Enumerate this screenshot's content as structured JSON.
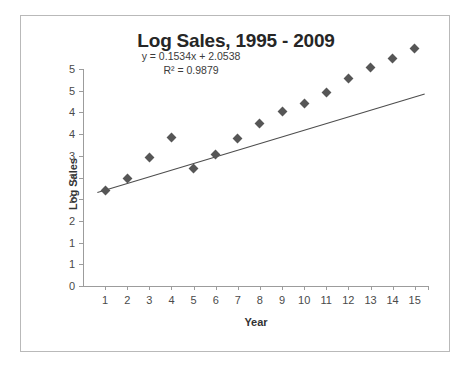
{
  "chart_data": {
    "type": "scatter",
    "title": "Log Sales, 1995 - 2009",
    "xlabel": "Year",
    "ylabel": "Log Sales",
    "x": [
      1,
      2,
      3,
      4,
      5,
      6,
      7,
      8,
      9,
      10,
      11,
      12,
      13,
      14,
      15
    ],
    "values": [
      2.21,
      2.48,
      2.97,
      3.42,
      2.7,
      3.03,
      3.39,
      3.74,
      4.02,
      4.21,
      4.46,
      4.79,
      5.04,
      5.24,
      5.47
    ],
    "series": [
      {
        "name": "Log Sales",
        "values": [
          2.21,
          2.48,
          2.97,
          3.42,
          2.7,
          3.03,
          3.39,
          3.74,
          4.02,
          4.21,
          4.46,
          4.79,
          5.04,
          5.24,
          5.47
        ]
      }
    ],
    "xlim": [
      0,
      15.6
    ],
    "ylim": [
      0,
      5
    ],
    "x_tick_labels": [
      "1",
      "2",
      "3",
      "4",
      "5",
      "6",
      "7",
      "8",
      "9",
      "10",
      "11",
      "12",
      "13",
      "14",
      "15"
    ],
    "y_ticks": [
      0,
      0.5,
      1,
      1.5,
      2,
      2.5,
      3,
      3.5,
      4,
      4.5,
      5
    ],
    "y_tick_labels": [
      "0",
      "1",
      "1",
      "2",
      "2",
      "3",
      "3",
      "4",
      "4",
      "5",
      "5"
    ],
    "grid": false,
    "legend": false,
    "trendline": {
      "equation": "y = 0.1534x + 2.0538",
      "r_squared_label": "R² = 0.9879",
      "slope": 0.1534,
      "intercept": 2.0538,
      "r_squared": 0.9879,
      "color": "#4d4d4d"
    },
    "marker_color": "#565656",
    "axis_color": "#9c9c9c",
    "title_color": "#262626",
    "border_color": "#b9b9b9"
  }
}
